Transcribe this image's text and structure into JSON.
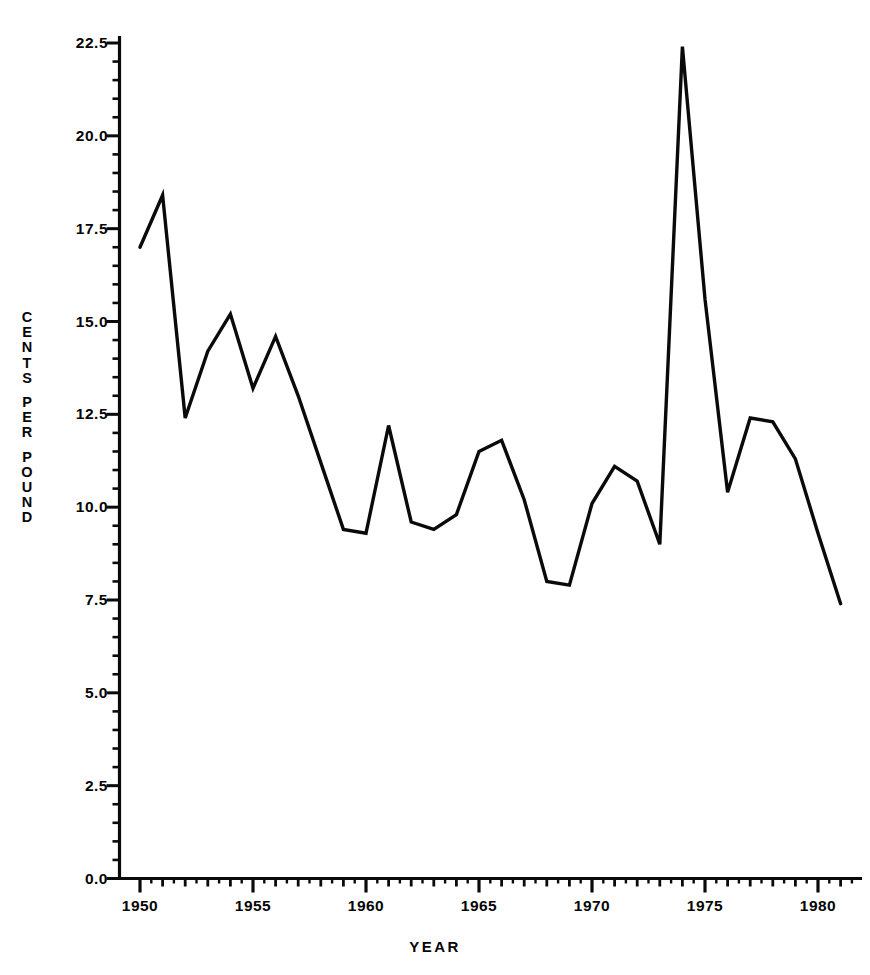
{
  "chart_data": {
    "type": "line",
    "title": "",
    "xlabel": "YEAR",
    "ylabel": "CENTS PER POUND",
    "ylabel_letters": [
      "C",
      "E",
      "N",
      "T",
      "S",
      "",
      "P",
      "E",
      "R",
      "",
      "P",
      "O",
      "U",
      "N",
      "D"
    ],
    "xlim": [
      1950,
      1981
    ],
    "ylim": [
      0.0,
      22.5
    ],
    "grid": false,
    "legend": "none",
    "x_tick_labels": [
      "1950",
      "1955",
      "1960",
      "1965",
      "1970",
      "1975",
      "1980"
    ],
    "x_ticks": [
      1950,
      1955,
      1960,
      1965,
      1970,
      1975,
      1980
    ],
    "y_tick_labels": [
      "0.0",
      "2.5",
      "5.0",
      "7.5",
      "10.0",
      "12.5",
      "15.0",
      "17.5",
      "20.0",
      "22.5"
    ],
    "y_ticks": [
      0.0,
      2.5,
      5.0,
      7.5,
      10.0,
      12.5,
      15.0,
      17.5,
      20.0,
      22.5
    ],
    "minor_ticks_per_interval": 5,
    "line_color": "#0a0a0a",
    "line_width": 3.4,
    "series": [
      {
        "name": "Cents per pound",
        "x": [
          1950,
          1951,
          1952,
          1953,
          1954,
          1955,
          1956,
          1957,
          1958,
          1959,
          1960,
          1961,
          1962,
          1963,
          1964,
          1965,
          1966,
          1967,
          1968,
          1969,
          1970,
          1971,
          1972,
          1973,
          1974,
          1975,
          1976,
          1977,
          1978,
          1979,
          1980,
          1981
        ],
        "values": [
          17.0,
          18.4,
          12.4,
          14.2,
          15.2,
          13.2,
          14.6,
          13.0,
          11.2,
          9.4,
          9.3,
          12.2,
          9.6,
          9.4,
          9.8,
          11.5,
          11.8,
          10.2,
          8.0,
          7.9,
          10.1,
          11.1,
          10.7,
          9.0,
          22.4,
          15.6,
          10.4,
          12.4,
          12.3,
          11.3,
          9.3,
          7.4
        ]
      }
    ]
  },
  "axes": {
    "y_axis_name": "cents-per-pound-axis",
    "x_axis_name": "year-axis"
  }
}
